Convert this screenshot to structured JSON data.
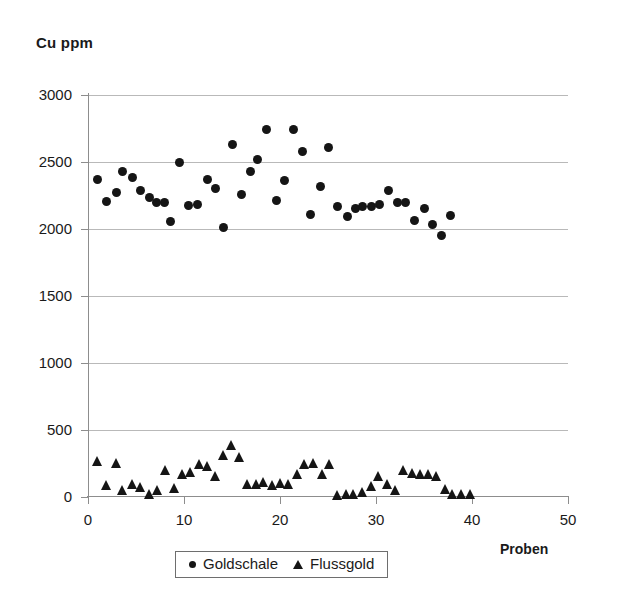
{
  "chart_data": {
    "type": "scatter",
    "title": "Cu ppm",
    "xlabel": "Proben",
    "ylabel": "Cu ppm",
    "xlim": [
      0,
      50
    ],
    "ylim": [
      0,
      3000
    ],
    "xticks": [
      0,
      10,
      20,
      30,
      40,
      50
    ],
    "yticks": [
      0,
      500,
      1000,
      1500,
      2000,
      2500,
      3000
    ],
    "grid": "horizontal",
    "legend_position": "bottom-center",
    "marker_color": "#151515",
    "gridline_color": "#b9b9b9",
    "axis_color": "#8d8d8d",
    "series": [
      {
        "name": "Goldschale",
        "marker": "circle",
        "points": [
          [
            1.0,
            2370
          ],
          [
            1.9,
            2205
          ],
          [
            3.0,
            2270
          ],
          [
            3.6,
            2430
          ],
          [
            4.6,
            2385
          ],
          [
            5.5,
            2290
          ],
          [
            6.4,
            2235
          ],
          [
            7.1,
            2200
          ],
          [
            8.0,
            2195
          ],
          [
            8.6,
            2055
          ],
          [
            9.5,
            2495
          ],
          [
            10.5,
            2175
          ],
          [
            11.4,
            2185
          ],
          [
            12.4,
            2370
          ],
          [
            13.3,
            2300
          ],
          [
            14.1,
            2010
          ],
          [
            15.0,
            2630
          ],
          [
            16.0,
            2255
          ],
          [
            16.9,
            2430
          ],
          [
            17.7,
            2520
          ],
          [
            18.6,
            2745
          ],
          [
            19.6,
            2215
          ],
          [
            20.5,
            2360
          ],
          [
            21.4,
            2745
          ],
          [
            22.3,
            2580
          ],
          [
            23.2,
            2110
          ],
          [
            24.2,
            2320
          ],
          [
            25.1,
            2610
          ],
          [
            26.0,
            2170
          ],
          [
            27.0,
            2095
          ],
          [
            27.9,
            2155
          ],
          [
            28.6,
            2170
          ],
          [
            29.5,
            2165
          ],
          [
            30.4,
            2185
          ],
          [
            31.3,
            2290
          ],
          [
            32.2,
            2200
          ],
          [
            33.1,
            2195
          ],
          [
            34.0,
            2060
          ],
          [
            35.0,
            2155
          ],
          [
            35.9,
            2035
          ],
          [
            36.8,
            1950
          ],
          [
            37.8,
            2100
          ]
        ]
      },
      {
        "name": "Flussgold",
        "marker": "triangle",
        "points": [
          [
            1.0,
            270
          ],
          [
            1.9,
            90
          ],
          [
            3.0,
            255
          ],
          [
            3.6,
            55
          ],
          [
            4.6,
            95
          ],
          [
            5.5,
            75
          ],
          [
            6.4,
            25
          ],
          [
            7.2,
            50
          ],
          [
            8.1,
            205
          ],
          [
            9.0,
            65
          ],
          [
            9.8,
            175
          ],
          [
            10.7,
            190
          ],
          [
            11.6,
            250
          ],
          [
            12.4,
            230
          ],
          [
            13.3,
            160
          ],
          [
            14.1,
            310
          ],
          [
            14.9,
            385
          ],
          [
            15.8,
            300
          ],
          [
            16.6,
            95
          ],
          [
            17.5,
            100
          ],
          [
            18.3,
            110
          ],
          [
            19.2,
            90
          ],
          [
            20.0,
            105
          ],
          [
            20.9,
            95
          ],
          [
            21.8,
            170
          ],
          [
            22.6,
            250
          ],
          [
            23.5,
            255
          ],
          [
            24.4,
            175
          ],
          [
            25.2,
            250
          ],
          [
            26.0,
            15
          ],
          [
            26.9,
            20
          ],
          [
            27.7,
            25
          ],
          [
            28.6,
            40
          ],
          [
            29.5,
            85
          ],
          [
            30.3,
            160
          ],
          [
            31.2,
            95
          ],
          [
            32.0,
            50
          ],
          [
            32.9,
            205
          ],
          [
            33.8,
            180
          ],
          [
            34.6,
            175
          ],
          [
            35.5,
            170
          ],
          [
            36.3,
            155
          ],
          [
            37.2,
            60
          ],
          [
            38.0,
            20
          ],
          [
            38.9,
            25
          ],
          [
            39.8,
            20
          ]
        ]
      }
    ]
  },
  "legend": {
    "items": [
      {
        "label": "Goldschale",
        "marker": "circle"
      },
      {
        "label": "Flussgold",
        "marker": "triangle"
      }
    ]
  }
}
